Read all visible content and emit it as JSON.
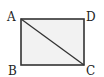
{
  "diagram": {
    "type": "rectangle-with-diagonal",
    "vertices": {
      "A": {
        "label": "A",
        "x": 21,
        "y": 19
      },
      "B": {
        "label": "B",
        "x": 21,
        "y": 65
      },
      "C": {
        "label": "C",
        "x": 84,
        "y": 65
      },
      "D": {
        "label": "D",
        "x": 84,
        "y": 19
      }
    },
    "edges": [
      "AB",
      "BC",
      "CD",
      "DA"
    ],
    "diagonal": "AC",
    "fill_color": "#f2f2f2",
    "stroke_color": "#333333"
  }
}
